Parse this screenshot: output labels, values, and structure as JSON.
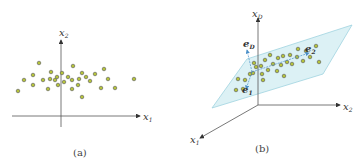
{
  "panel_a": {
    "caption": "(a)",
    "axis_x_label": "x",
    "axis_x_sub": "1",
    "axis_y_label": "x",
    "axis_y_sub": "2",
    "points": [
      [
        18,
        91
      ],
      [
        24,
        80
      ],
      [
        33,
        85
      ],
      [
        33,
        75
      ],
      [
        39,
        63
      ],
      [
        43,
        80
      ],
      [
        48,
        89
      ],
      [
        50,
        79
      ],
      [
        51,
        72
      ],
      [
        55,
        80
      ],
      [
        57,
        77
      ],
      [
        58,
        85
      ],
      [
        62,
        73
      ],
      [
        64,
        82
      ],
      [
        68,
        77
      ],
      [
        72,
        80
      ],
      [
        72,
        89
      ],
      [
        73,
        66
      ],
      [
        78,
        85
      ],
      [
        79,
        79
      ],
      [
        82,
        73
      ],
      [
        82,
        97
      ],
      [
        86,
        77
      ],
      [
        90,
        81
      ],
      [
        95,
        74
      ],
      [
        101,
        88
      ],
      [
        104,
        69
      ],
      [
        108,
        79
      ],
      [
        115,
        88
      ],
      [
        134,
        79
      ]
    ],
    "point_fill": "#b5c33a",
    "point_stroke": "#555555"
  },
  "panel_b": {
    "caption": "(b)",
    "axis_x1_label": "x",
    "axis_x1_sub": "1",
    "axis_x2_label": "x",
    "axis_x2_sub": "2",
    "axis_xD_label": "x",
    "axis_xD_sub": "D",
    "vec_e1": "e",
    "vec_e1_sub": "1",
    "vec_e2": "e",
    "vec_e2_sub": "2",
    "vec_eD": "e",
    "vec_eD_sub": "D",
    "plane_color": "#d6eef3",
    "plane_stroke": "#9fd3df",
    "vector_color": "#4a8fc9",
    "points": [
      [
        236,
        90
      ],
      [
        243,
        89
      ],
      [
        238,
        79
      ],
      [
        245,
        80
      ],
      [
        250,
        74
      ],
      [
        254,
        63
      ],
      [
        253,
        73
      ],
      [
        256,
        67
      ],
      [
        261,
        66
      ],
      [
        262,
        74
      ],
      [
        263,
        80
      ],
      [
        265,
        60
      ],
      [
        268,
        70
      ],
      [
        270,
        55
      ],
      [
        273,
        64
      ],
      [
        277,
        71
      ],
      [
        278,
        58
      ],
      [
        281,
        65
      ],
      [
        283,
        56
      ],
      [
        284,
        76
      ],
      [
        287,
        62
      ],
      [
        290,
        55
      ],
      [
        292,
        64
      ],
      [
        297,
        57
      ],
      [
        298,
        49
      ],
      [
        303,
        61
      ],
      [
        306,
        51
      ],
      [
        310,
        57
      ],
      [
        316,
        46
      ],
      [
        319,
        62
      ]
    ]
  }
}
